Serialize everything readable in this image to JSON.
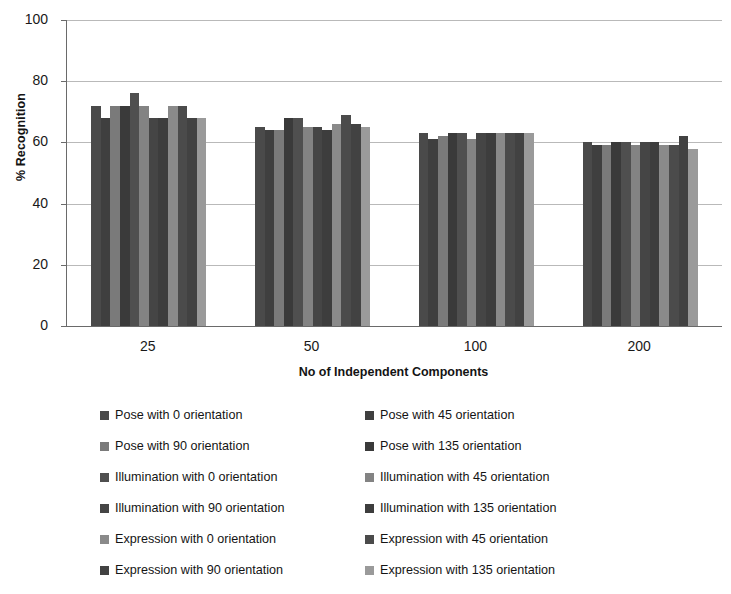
{
  "chart_data": {
    "type": "bar",
    "title": "",
    "xlabel": "No of Independent Components",
    "ylabel": "% Recognition",
    "categories": [
      "25",
      "50",
      "100",
      "200"
    ],
    "ylim": [
      0,
      100
    ],
    "yticks": [
      0,
      20,
      40,
      60,
      80,
      100
    ],
    "grid": true,
    "legend_position": "bottom",
    "series": [
      {
        "name": "Pose with 0 orientation",
        "color": "#4a4a4a",
        "values": [
          72,
          65,
          63,
          60
        ]
      },
      {
        "name": "Pose with 45 orientation",
        "color": "#3f3f3f",
        "values": [
          68,
          64,
          61,
          59
        ]
      },
      {
        "name": "Pose with 90 orientation",
        "color": "#7a7a7a",
        "values": [
          72,
          64,
          62,
          59
        ]
      },
      {
        "name": "Pose with 135 orientation",
        "color": "#3a3a3a",
        "values": [
          72,
          68,
          63,
          60
        ]
      },
      {
        "name": "Illumination with 0 orientation",
        "color": "#4f4f4f",
        "values": [
          76,
          68,
          63,
          60
        ]
      },
      {
        "name": "Illumination with 45 orientation",
        "color": "#838383",
        "values": [
          72,
          65,
          61,
          59
        ]
      },
      {
        "name": "Illumination with 90 orientation",
        "color": "#454545",
        "values": [
          68,
          65,
          63,
          60
        ]
      },
      {
        "name": "Illumination with 135 orientation",
        "color": "#3d3d3d",
        "values": [
          68,
          64,
          63,
          60
        ]
      },
      {
        "name": "Expression with 0 orientation",
        "color": "#8a8a8a",
        "values": [
          72,
          66,
          63,
          59
        ]
      },
      {
        "name": "Expression with 45 orientation",
        "color": "#4b4b4b",
        "values": [
          72,
          69,
          63,
          59
        ]
      },
      {
        "name": "Expression with 90 orientation",
        "color": "#424242",
        "values": [
          68,
          66,
          63,
          62
        ]
      },
      {
        "name": "Expression with 135 orientation",
        "color": "#9a9a9a",
        "values": [
          68,
          65,
          63,
          58
        ]
      }
    ]
  }
}
